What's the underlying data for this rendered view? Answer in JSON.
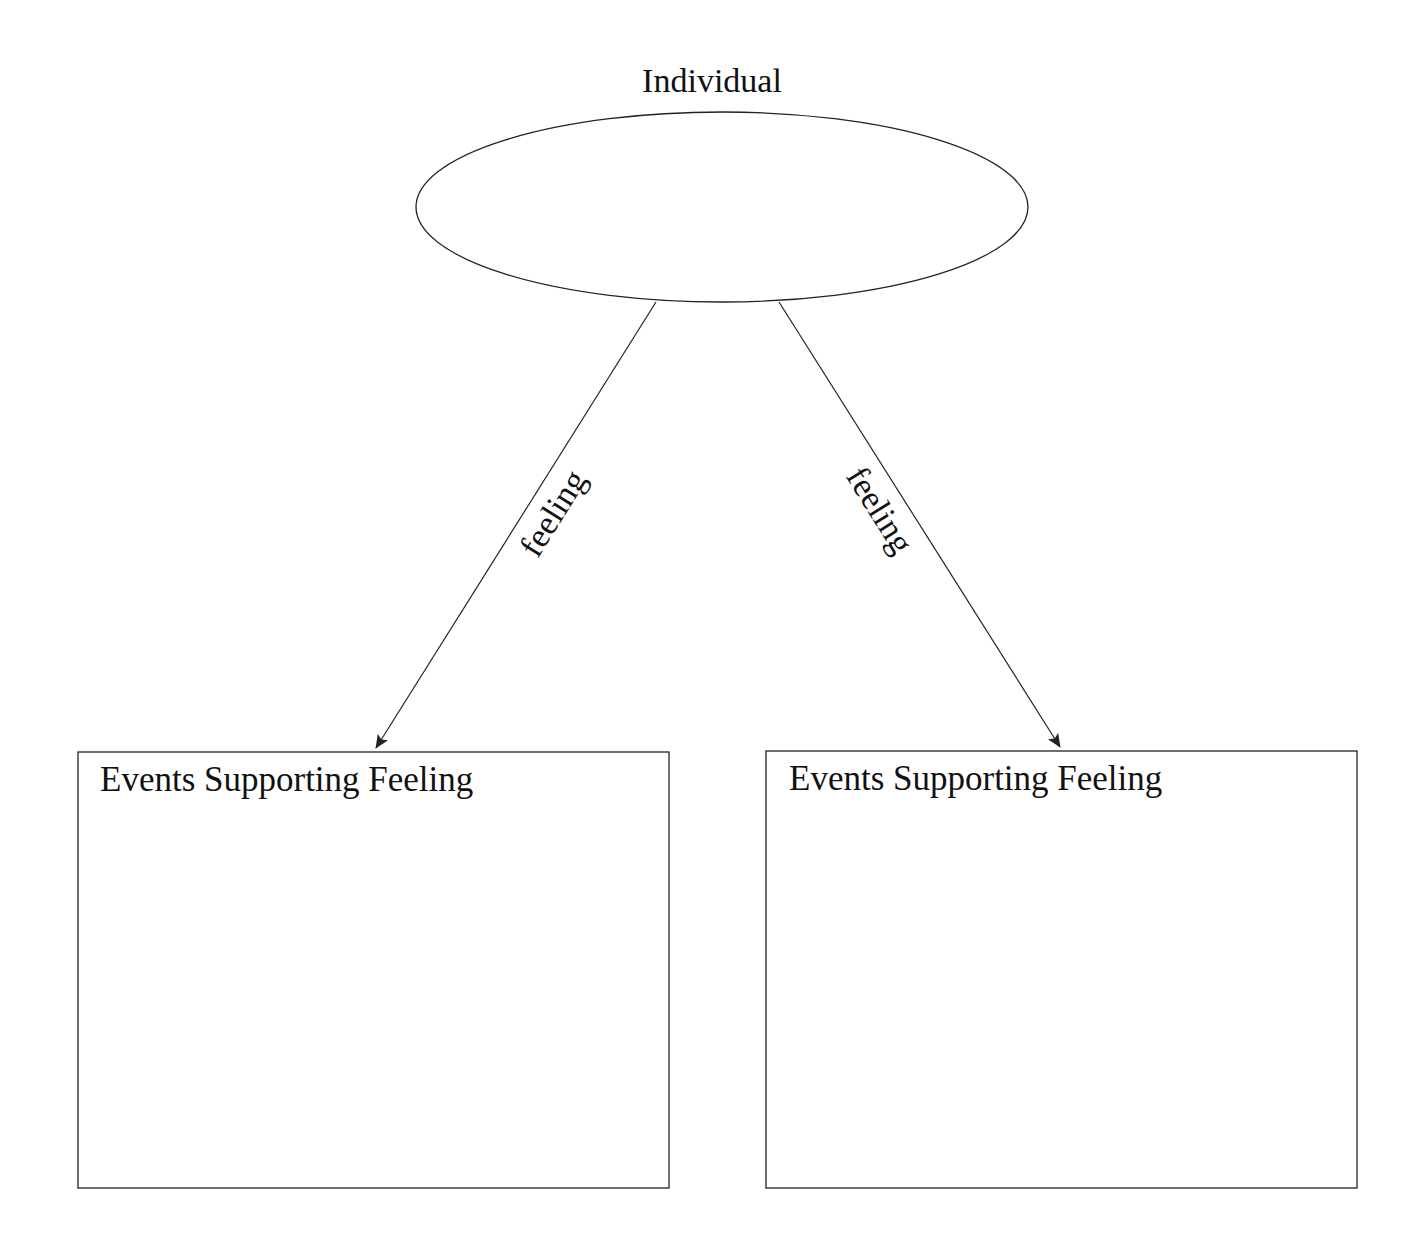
{
  "diagram": {
    "root": {
      "label": "Individual",
      "shape": "ellipse"
    },
    "edges": [
      {
        "label": "feeling",
        "from": "root",
        "to": "left_box"
      },
      {
        "label": "feeling",
        "from": "root",
        "to": "right_box"
      }
    ],
    "boxes": [
      {
        "id": "left_box",
        "title": "Events Supporting Feeling"
      },
      {
        "id": "right_box",
        "title": "Events Supporting Feeling"
      }
    ],
    "colors": {
      "stroke": "#222222",
      "text": "#111111",
      "background": "#ffffff"
    }
  }
}
